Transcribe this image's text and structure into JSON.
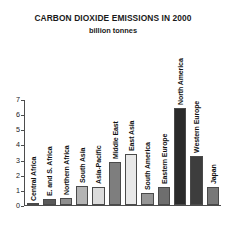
{
  "chart_data": {
    "type": "bar",
    "title": "CARBON DIOXIDE EMISSIONS IN 2000",
    "subtitle": "billion tonnes",
    "xlabel": "",
    "ylabel": "",
    "ylim": [
      0,
      7
    ],
    "yticks": [
      0,
      1,
      2,
      3,
      4,
      5,
      6,
      7
    ],
    "ytick_labels": [
      "0",
      "1",
      "2",
      "3",
      "4",
      "5",
      "6",
      "7"
    ],
    "grid": false,
    "legend": false,
    "units": "billion tonnes",
    "categories": [
      "Central Africa",
      "E. and S. Africa",
      "Northern Africa",
      "South Asia",
      "Asia-Pacific",
      "Middle East",
      "East Asia",
      "South America",
      "Eastern Europe",
      "North America",
      "Western Europe",
      "Japan"
    ],
    "values": [
      0.05,
      0.4,
      0.45,
      1.25,
      1.2,
      2.9,
      3.4,
      0.8,
      1.2,
      6.5,
      3.3,
      1.2
    ],
    "bar_colors": [
      "#808080",
      "#5a5a5a",
      "#8f8f8f",
      "#b4b4b4",
      "#dcdcdc",
      "#7e7e7e",
      "#e8e8e8",
      "#969696",
      "#6e6e6e",
      "#2b2b2b",
      "#3d3d3d",
      "#787878"
    ]
  },
  "style": {
    "axis_color": "#4d4d4d",
    "text_color": "#1a1a1a",
    "background": "#ffffff"
  }
}
